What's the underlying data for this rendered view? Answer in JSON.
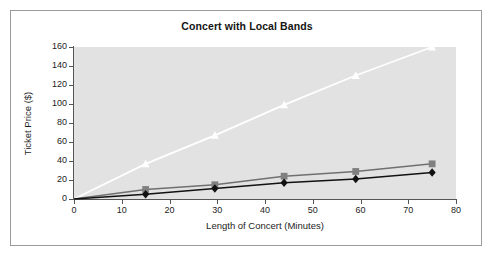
{
  "chart_data": {
    "type": "line",
    "title": "Concert with Local Bands",
    "xlabel": "Length of Concert (Minutes)",
    "ylabel": "Ticket Price ($)",
    "xlim": [
      0,
      80
    ],
    "ylim": [
      0,
      160
    ],
    "xticks": [
      0,
      10,
      20,
      30,
      40,
      50,
      60,
      70,
      80
    ],
    "yticks": [
      0,
      20,
      40,
      60,
      80,
      100,
      120,
      140,
      160
    ],
    "grid": false,
    "legend": "none",
    "plot_background": "#e2e2e2",
    "x": [
      0,
      15,
      29.5,
      44,
      59,
      75
    ],
    "series": [
      {
        "name": "white-triangle-series",
        "marker": "triangle",
        "color": "#ffffff",
        "line_color": "#ffffff",
        "values": [
          0,
          37,
          67,
          99,
          130,
          160
        ]
      },
      {
        "name": "gray-square-series",
        "marker": "square",
        "color": "#808080",
        "line_color": "#707070",
        "values": [
          0,
          10,
          15,
          24,
          29,
          37
        ]
      },
      {
        "name": "black-diamond-series",
        "marker": "diamond",
        "color": "#111111",
        "line_color": "#111111",
        "values": [
          0,
          5,
          11,
          17,
          21,
          28
        ]
      }
    ]
  }
}
